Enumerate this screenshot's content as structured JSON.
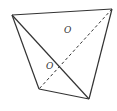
{
  "diagram": {
    "type": "geometry-quadrilateral-with-diagonals",
    "vertices": {
      "A": [
        12,
        15
      ],
      "B": [
        112,
        9
      ],
      "C": [
        89,
        99
      ],
      "D": [
        39,
        89
      ]
    },
    "edges": [
      {
        "from": "A",
        "to": "B",
        "style": "solid"
      },
      {
        "from": "B",
        "to": "C",
        "style": "solid"
      },
      {
        "from": "C",
        "to": "D",
        "style": "solid"
      },
      {
        "from": "D",
        "to": "A",
        "style": "solid"
      },
      {
        "from": "A",
        "to": "C",
        "style": "solid"
      },
      {
        "from": "B",
        "to": "D",
        "style": "dashed"
      }
    ],
    "labels": [
      {
        "text": "O",
        "x": 64,
        "y": 33
      },
      {
        "text": "O",
        "x": 46,
        "y": 69
      }
    ],
    "colors": {
      "stroke": "#333333",
      "background": "#ffffff"
    }
  }
}
